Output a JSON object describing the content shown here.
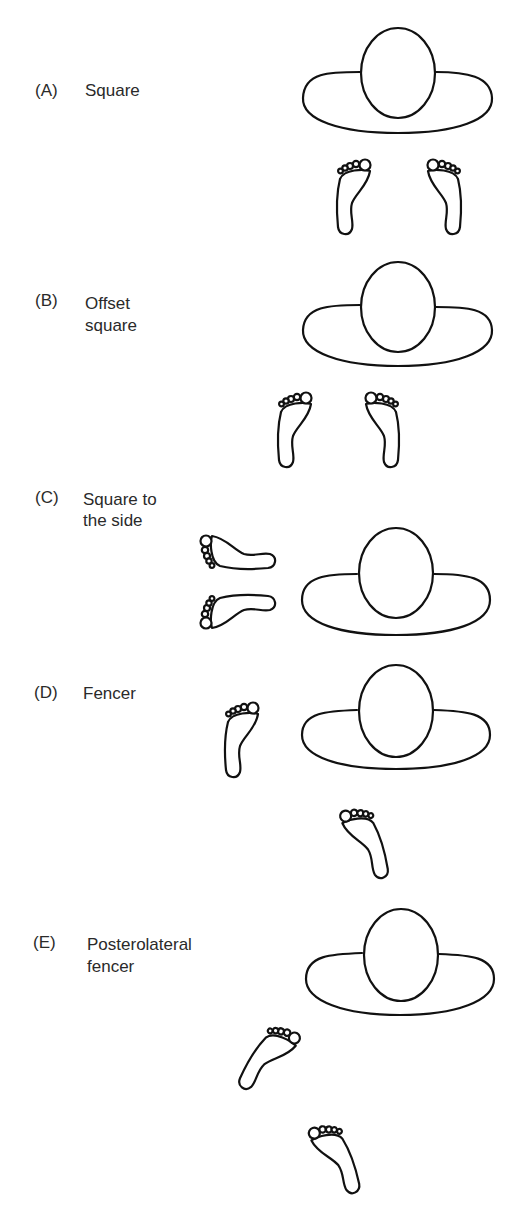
{
  "figure": {
    "panels": [
      {
        "letter": "(A)",
        "line1": "Square",
        "line2": ""
      },
      {
        "letter": "(B)",
        "line1": "Offset",
        "line2": "square"
      },
      {
        "letter": "(C)",
        "line1": "Square to",
        "line2": "the side"
      },
      {
        "letter": "(D)",
        "line1": "Fencer",
        "line2": ""
      },
      {
        "letter": "(E)",
        "line1": "Posterolateral",
        "line2": "fencer"
      }
    ],
    "colors": {
      "ink": "#111111",
      "text": "#2a2a2a",
      "background": "#ffffff"
    }
  }
}
